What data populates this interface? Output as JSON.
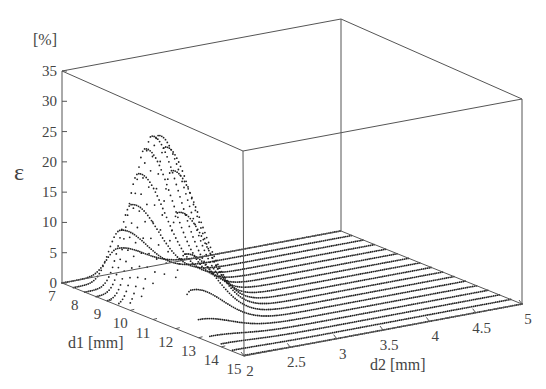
{
  "chart_data": {
    "type": "scatter3d",
    "title": "",
    "zlabel": "ε",
    "zunit": "[%]",
    "xlabel": "d1 [mm]",
    "ylabel": "d2 [mm]",
    "z_ticks": [
      "0",
      "5",
      "10",
      "15",
      "20",
      "25",
      "30",
      "35"
    ],
    "x_ticks": [
      "7",
      "8",
      "9",
      "10",
      "11",
      "12",
      "13",
      "14",
      "15"
    ],
    "y_ticks": [
      "2",
      "2.5",
      "3",
      "3.5",
      "4",
      "4.5",
      "5"
    ],
    "zlim": [
      0,
      35
    ],
    "xlim": [
      7,
      15
    ],
    "ylim": [
      2,
      5
    ],
    "grid": false,
    "legend": null,
    "series": [
      {
        "d1": 7,
        "peak_eps": 4,
        "peak_d2": 2.6
      },
      {
        "d1": 7.5,
        "peak_eps": 8,
        "peak_d2": 2.5
      },
      {
        "d1": 8,
        "peak_eps": 13,
        "peak_d2": 2.5
      },
      {
        "d1": 8.5,
        "peak_eps": 19,
        "peak_d2": 2.45
      },
      {
        "d1": 9,
        "peak_eps": 24,
        "peak_d2": 2.4
      },
      {
        "d1": 9.5,
        "peak_eps": 27,
        "peak_d2": 2.35
      },
      {
        "d1": 10,
        "peak_eps": 28,
        "peak_d2": 2.3
      },
      {
        "d1": 10.5,
        "peak_eps": 27,
        "peak_d2": 2.25
      },
      {
        "d1": 11,
        "peak_eps": 24,
        "peak_d2": 2.2
      },
      {
        "d1": 11.5,
        "peak_eps": 18,
        "peak_d2": 2.15
      },
      {
        "d1": 12,
        "peak_eps": 12,
        "peak_d2": 2.1
      },
      {
        "d1": 12.5,
        "peak_eps": 7,
        "peak_d2": 2.05
      },
      {
        "d1": 13,
        "peak_eps": 3,
        "peak_d2": 2.0
      },
      {
        "d1": 13.5,
        "peak_eps": 1,
        "peak_d2": 2.0
      },
      {
        "d1": 14,
        "peak_eps": 0.5,
        "peak_d2": 2.0
      },
      {
        "d1": 14.5,
        "peak_eps": 0.2,
        "peak_d2": 2.0
      },
      {
        "d1": 15,
        "peak_eps": 0.1,
        "peak_d2": 2.0
      }
    ]
  }
}
